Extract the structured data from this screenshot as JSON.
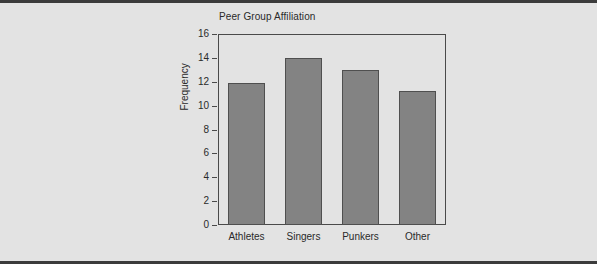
{
  "chart_data": {
    "type": "bar",
    "title": "Peer Group Affiliation",
    "xlabel": "",
    "ylabel": "Frequency",
    "categories": [
      "Athletes",
      "Singers",
      "Punkers",
      "Other"
    ],
    "values": [
      11.9,
      14.0,
      13.0,
      11.2
    ],
    "ylim": [
      0,
      16
    ],
    "yticks": [
      "0",
      "2",
      "4",
      "6",
      "8",
      "10",
      "12",
      "14",
      "16"
    ],
    "ytick_values": [
      0,
      2,
      4,
      6,
      8,
      10,
      12,
      14,
      16
    ],
    "grid": false,
    "legend": false,
    "bar_color": "#838383",
    "bar_border_color": "#4f4f4f",
    "axis_color": "#4a4a4a",
    "background_color": "#e3e3e3",
    "frame_border_color": "#3b3b3b"
  }
}
